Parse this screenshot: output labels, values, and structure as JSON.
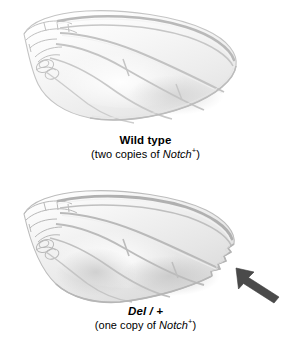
{
  "figure": {
    "background_color": "#ffffff",
    "panels": [
      {
        "id": "wild-type",
        "caption_title": "Wild type",
        "caption_sub_prefix": "(two copies of ",
        "caption_gene": "Notch",
        "caption_gene_superscript": "+",
        "caption_sub_suffix": ")",
        "specimen": "drosophila-wing",
        "phenotype": "normal smooth wing margin"
      },
      {
        "id": "mutant",
        "caption_title": "Del / +",
        "caption_title_style": "bold-italic",
        "caption_sub_prefix": "(one copy of ",
        "caption_gene": "Notch",
        "caption_gene_superscript": "+",
        "caption_sub_suffix": ")",
        "specimen": "drosophila-wing",
        "phenotype": "notched wing margin"
      }
    ],
    "annotation": {
      "arrow_label": "arrow pointing to notched wing margin",
      "arrow_color": "#4a4a4a",
      "arrow_direction": "up-left"
    },
    "colors": {
      "wing_outline": "#bdbdbd",
      "wing_vein": "#c9c9c9",
      "wing_fill_light": "#fbfbfb",
      "wing_fill_mid": "#eeeeee",
      "wing_fill_shadow": "#dddddd",
      "text": "#000000",
      "arrow": "#4a4a4a"
    }
  }
}
